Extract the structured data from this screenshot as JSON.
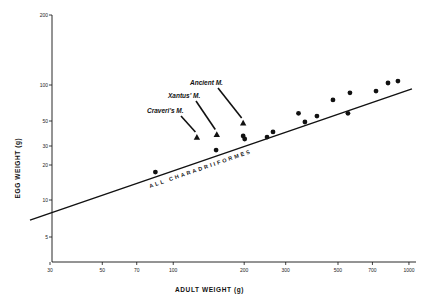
{
  "chart_data": {
    "type": "scatter",
    "title": "",
    "xlabel": "ADULT  WEIGHT   (g)",
    "ylabel": "EGG   WEIGHT   (g)",
    "x_scale": "log",
    "y_scale": "log",
    "xlim": [
      30,
      1000
    ],
    "ylim": [
      5,
      200
    ],
    "x_ticks": [
      30,
      50,
      70,
      100,
      200,
      300,
      500,
      700,
      1000
    ],
    "y_ticks": [
      5,
      10,
      20,
      30,
      50,
      100,
      200
    ],
    "grid": false,
    "legend": null,
    "series": [
      {
        "name": "Other Charadriiformes species",
        "marker": "circle",
        "points": [
          {
            "x": 84,
            "y": 17.4
          },
          {
            "x": 152,
            "y": 27.5
          },
          {
            "x": 198,
            "y": 36.8
          },
          {
            "x": 201,
            "y": 34.6
          },
          {
            "x": 250,
            "y": 36
          },
          {
            "x": 265,
            "y": 40
          },
          {
            "x": 340,
            "y": 58
          },
          {
            "x": 362,
            "y": 49
          },
          {
            "x": 407,
            "y": 55
          },
          {
            "x": 476,
            "y": 75
          },
          {
            "x": 551,
            "y": 58
          },
          {
            "x": 562,
            "y": 86
          },
          {
            "x": 725,
            "y": 89
          },
          {
            "x": 815,
            "y": 102
          },
          {
            "x": 898,
            "y": 104
          }
        ]
      },
      {
        "name": "Murrelets (Synthliboramphus)",
        "marker": "triangle",
        "points": [
          {
            "x": 126,
            "y": 36,
            "label": "Craveri's M."
          },
          {
            "x": 153,
            "y": 38,
            "label": "Xantus' M."
          },
          {
            "x": 198,
            "y": 48,
            "label": "Ancient M."
          }
        ]
      },
      {
        "name": "ALL CHARADRIIFORMES",
        "type": "line",
        "points": [
          {
            "x": 30,
            "y": 7.8
          },
          {
            "x": 1000,
            "y": 91
          }
        ]
      }
    ],
    "annotations": [
      {
        "text": "Craveri's M.",
        "target": "Craveri's M."
      },
      {
        "text": "Xantus' M.",
        "target": "Xantus' M."
      },
      {
        "text": "Ancient M.",
        "target": "Ancient M."
      },
      {
        "text": "ALL  CHARADRIIFORMES",
        "target": "regression line"
      }
    ]
  },
  "layout": {
    "x_axis_px": {
      "x0": 50,
      "log_x0": 30,
      "px_per_decade": 235.7
    },
    "y_tick_px": [
      [
        200,
        15
      ],
      [
        100,
        85
      ],
      [
        50,
        121
      ],
      [
        30,
        146
      ],
      [
        20,
        165
      ],
      [
        10,
        200
      ],
      [
        5,
        237
      ]
    ],
    "plot": {
      "left": 52,
      "top": 15,
      "right": 416,
      "bottom": 262
    },
    "ink_color": "#111111"
  }
}
